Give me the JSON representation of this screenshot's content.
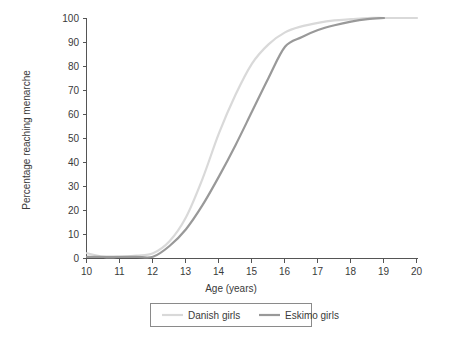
{
  "chart_data": {
    "type": "line",
    "title": "",
    "xlabel": "Age (years)",
    "ylabel": "Percentage reaching menarche",
    "xlim": [
      10,
      20
    ],
    "ylim": [
      0,
      100
    ],
    "xticks": [
      10,
      11,
      12,
      13,
      14,
      15,
      16,
      17,
      18,
      19,
      20
    ],
    "yticks": [
      0,
      10,
      20,
      30,
      40,
      50,
      60,
      70,
      80,
      90,
      100
    ],
    "grid": false,
    "legend_position": "bottom-center",
    "series": [
      {
        "name": "Danish girls",
        "color": "#d9d9d9",
        "x": [
          10,
          10.5,
          11,
          11.5,
          12,
          12.5,
          13,
          13.5,
          14,
          14.5,
          15,
          15.5,
          16,
          16.5,
          17,
          17.5,
          18,
          18.5,
          19,
          19.5,
          20
        ],
        "values": [
          2,
          0.5,
          0.5,
          1,
          2,
          7,
          17,
          33,
          52,
          68,
          81,
          89,
          94,
          96.5,
          98,
          99,
          99.5,
          100,
          100,
          100,
          100
        ]
      },
      {
        "name": "Eskimo girls",
        "color": "#999999",
        "x": [
          10,
          10.5,
          11,
          11.5,
          12,
          12.5,
          13,
          13.5,
          14,
          14.5,
          15,
          15.5,
          16,
          16.5,
          17,
          17.5,
          18,
          18.5,
          19
        ],
        "values": [
          0.5,
          0.5,
          0.5,
          0.5,
          0.5,
          5,
          12,
          22,
          34,
          47,
          61,
          75,
          88,
          92,
          95,
          97,
          98.5,
          99.5,
          100
        ]
      }
    ]
  },
  "legend": {
    "entries": [
      {
        "label": "Danish girls"
      },
      {
        "label": "Eskimo girls"
      }
    ]
  }
}
